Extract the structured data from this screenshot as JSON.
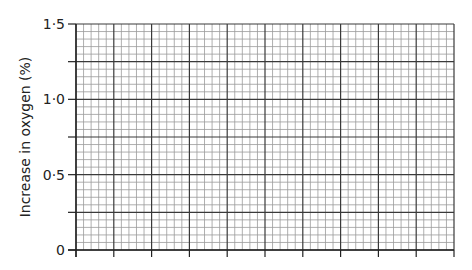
{
  "chart_data": {
    "type": "line",
    "title": "",
    "xlabel": "",
    "ylabel": "Increase in oxygen (%)",
    "ylim": [
      0,
      1.5
    ],
    "yticks": [
      0,
      0.5,
      1.0,
      1.5
    ],
    "ytick_labels": [
      "0",
      "0·5",
      "1·0",
      "1·5"
    ],
    "x_major_divisions": 10,
    "x_minor_per_major": 5,
    "y_major_divisions": 6,
    "y_minor_per_major": 5,
    "grid": true,
    "series": [],
    "note": "Blank graph paper grid with no plotted data"
  },
  "colors": {
    "grid_minor": "#9a9a9a",
    "grid_major": "#3a3a3a",
    "axis": "#222222",
    "text": "#222222"
  }
}
